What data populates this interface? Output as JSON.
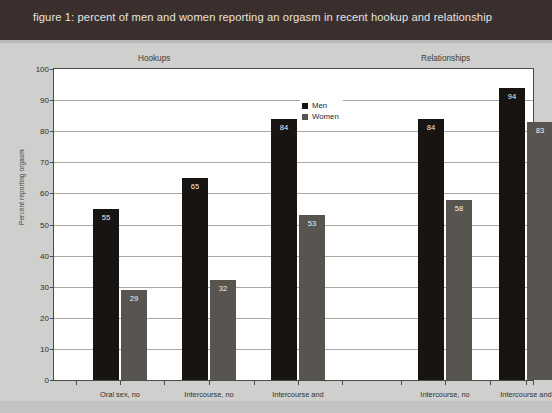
{
  "figure": {
    "title": "figure 1: percent of men and women reporting an orgasm in recent hookup and relationship",
    "title_band_color": "#3a2f2c",
    "background_color": "#cfcfcd"
  },
  "legend": {
    "position": "top-center",
    "entries": [
      {
        "label": "Men",
        "color": "#171412",
        "swatch": "men-swatch-icon"
      },
      {
        "label": "Women",
        "color": "#585551",
        "swatch": "women-swatch-icon"
      }
    ]
  },
  "groups": [
    {
      "id": "hookups",
      "header": "Hookups"
    },
    {
      "id": "relationships",
      "header": "Relationships"
    }
  ],
  "axes": {
    "ylabel": "Percent reporting orgasm",
    "xlabel": "",
    "ylim": [
      0,
      100
    ],
    "yticks": [
      0,
      10,
      20,
      30,
      40,
      50,
      60,
      70,
      80,
      90,
      100
    ],
    "ytick_labels": [
      "0",
      "10",
      "20",
      "30",
      "40",
      "50",
      "60",
      "70",
      "80",
      "90",
      "100"
    ],
    "grid": true
  },
  "chart_data": {
    "type": "bar",
    "title": "figure 1: percent of men and women reporting an orgasm in recent hookup and relationship",
    "xlabel": "",
    "ylabel": "Percent reporting orgasm",
    "ylim": [
      0,
      100
    ],
    "yticks": [
      0,
      10,
      20,
      30,
      40,
      50,
      60,
      70,
      80,
      90,
      100
    ],
    "grid": true,
    "legend_position": "top-center",
    "groups": [
      "Hookups",
      "Relationships"
    ],
    "categories": [
      {
        "group": "Hookups",
        "label": "Oral sex, no intercourse",
        "label_lines": [
          "Oral sex, no",
          "intercourse"
        ]
      },
      {
        "group": "Hookups",
        "label": "Intercourse, no oral sex",
        "label_lines": [
          "Intercourse, no",
          "oral sex"
        ]
      },
      {
        "group": "Hookups",
        "label": "Intercourse and oral sex",
        "label_lines": [
          "Intercourse and",
          "oral sex"
        ]
      },
      {
        "group": "Relationships",
        "label": "Intercourse, no oral sex",
        "label_lines": [
          "Intercourse, no",
          "oral sex"
        ]
      },
      {
        "group": "Relationships",
        "label": "Intercourse and oral sex",
        "label_lines": [
          "Intercourse and",
          "oral sex"
        ]
      }
    ],
    "series": [
      {
        "name": "Men",
        "color": "#171412",
        "values": [
          55,
          65,
          84,
          84,
          94
        ]
      },
      {
        "name": "Women",
        "color": "#585551",
        "values": [
          29,
          32,
          53,
          58,
          83
        ]
      }
    ]
  },
  "bars": [
    {
      "cat": 0,
      "group": "Hookups",
      "series": "Men",
      "value": 55,
      "label": "55"
    },
    {
      "cat": 0,
      "group": "Hookups",
      "series": "Women",
      "value": 29,
      "label": "29"
    },
    {
      "cat": 1,
      "group": "Hookups",
      "series": "Men",
      "value": 65,
      "label": "65"
    },
    {
      "cat": 1,
      "group": "Hookups",
      "series": "Women",
      "value": 32,
      "label": "32"
    },
    {
      "cat": 2,
      "group": "Hookups",
      "series": "Men",
      "value": 84,
      "label": "84"
    },
    {
      "cat": 2,
      "group": "Hookups",
      "series": "Women",
      "value": 53,
      "label": "53"
    },
    {
      "cat": 3,
      "group": "Relationships",
      "series": "Men",
      "value": 84,
      "label": "84"
    },
    {
      "cat": 3,
      "group": "Relationships",
      "series": "Women",
      "value": 58,
      "label": "58"
    },
    {
      "cat": 4,
      "group": "Relationships",
      "series": "Men",
      "value": 94,
      "label": "94"
    },
    {
      "cat": 4,
      "group": "Relationships",
      "series": "Women",
      "value": 83,
      "label": "83"
    }
  ]
}
